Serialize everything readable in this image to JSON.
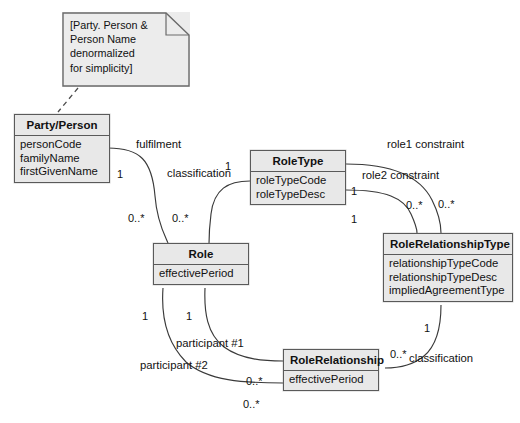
{
  "diagram": {
    "note": {
      "text": "[Party. Person &\nPerson Name\ndenormalized\nfor simplicity]"
    },
    "classes": [
      {
        "id": "party-person",
        "name": "Party/Person",
        "attributes": [
          "personCode",
          "familyName",
          "firstGivenName"
        ]
      },
      {
        "id": "role-type",
        "name": "RoleType",
        "attributes": [
          "roleTypeCode",
          "roleTypeDesc"
        ]
      },
      {
        "id": "role",
        "name": "Role",
        "attributes": [
          "effectivePeriod"
        ]
      },
      {
        "id": "role-relationship-type",
        "name": "RoleRelationshipType",
        "attributes": [
          "relationshipTypeCode",
          "relationshipTypeDesc",
          "impliedAgreementType"
        ]
      },
      {
        "id": "role-relationship",
        "name": "RoleRelationship",
        "attributes": [
          "effectivePeriod"
        ]
      }
    ],
    "association_labels": {
      "fulfilment": "fulfilment",
      "classification_role": "classification",
      "role1_constraint": "role1 constraint",
      "role2_constraint": "role2 constraint",
      "participant1": "participant #1",
      "participant2": "participant #2",
      "classification_relationship": "classification"
    },
    "multiplicities": {
      "party_person_one": "1",
      "role_from_party_many": "0..*",
      "role_from_type_many": "0..*",
      "role_type_top_one": "1",
      "role_type_role1_one": "1",
      "role_type_role2_one": "1",
      "rrt_role1_many": "0..*",
      "rrt_role2_many": "0..*",
      "role_participant1_one": "1",
      "role_participant2_one": "1",
      "rr_participant1_many": "0..*",
      "rr_participant2_many": "0..*",
      "rrt_classification_one": "1",
      "rr_classification_many": "0..*"
    },
    "colors": {
      "class_fill": "#e8e8e8",
      "class_border": "#5a5a5a",
      "note_fill": "#ececec",
      "connector": "#3a3a3a",
      "background": "#ffffff",
      "text": "#111111"
    }
  }
}
